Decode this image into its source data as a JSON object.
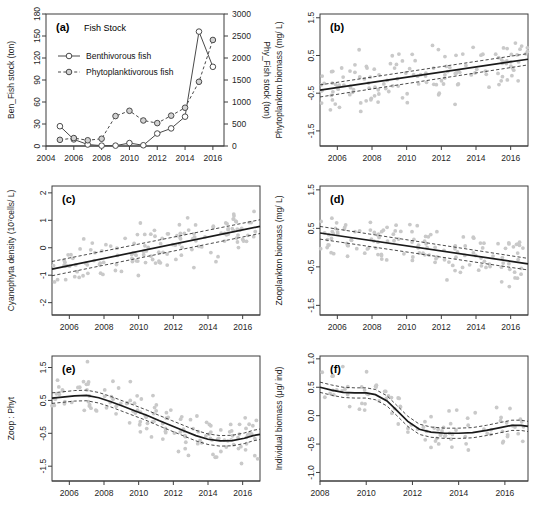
{
  "figure": {
    "panels": [
      "a",
      "b",
      "c",
      "d",
      "e",
      "f"
    ],
    "xlabel_years": [
      "2004",
      "2006",
      "2008",
      "2010",
      "2012",
      "2014",
      "2016"
    ]
  },
  "chart_data": [
    {
      "id": "a",
      "type": "line",
      "tag": "(a)",
      "title": "Fish Stock",
      "xlabel": "",
      "ylabel": "Ben_Fish stock (ton)",
      "y2label": "Phy_Fish stock (ton)",
      "xlim": [
        2004,
        2016.8
      ],
      "ylim": [
        0,
        180
      ],
      "y2lim": [
        0,
        3000
      ],
      "yticks": [
        0,
        30,
        60,
        90,
        120,
        150,
        180
      ],
      "y2ticks": [
        0,
        500,
        1000,
        1500,
        2000,
        2500,
        3000
      ],
      "xticks": [
        2004,
        2006,
        2008,
        2010,
        2012,
        2014,
        2016
      ],
      "grid": false,
      "legend_position": "top-left",
      "series": [
        {
          "name": "Benthivorous fish",
          "axis": "left",
          "style": "solid",
          "marker": "open-circle",
          "x": [
            2005,
            2006,
            2007,
            2008,
            2009,
            2010,
            2011,
            2012,
            2013,
            2014,
            2015,
            2016
          ],
          "values": [
            27,
            9,
            2,
            0.5,
            0.5,
            4,
            1,
            17,
            24,
            40,
            156,
            108
          ]
        },
        {
          "name": "Phytoplanktivorous fish",
          "axis": "right",
          "style": "dashed",
          "marker": "grey-circle",
          "x": [
            2005,
            2006,
            2007,
            2008,
            2009,
            2010,
            2011,
            2012,
            2013,
            2014,
            2015,
            2016
          ],
          "values": [
            140,
            180,
            130,
            165,
            680,
            800,
            580,
            520,
            690,
            870,
            1460,
            2410
          ]
        }
      ]
    },
    {
      "id": "b",
      "type": "scatter",
      "tag": "(b)",
      "ylabel": "Phytoplankton biomass (mg/ L)",
      "xlim": [
        2005,
        2017
      ],
      "ylim": [
        -1.9,
        1.6
      ],
      "yticks": [
        -1.5,
        -0.5,
        0.5,
        1.5
      ],
      "xticks": [
        2006,
        2008,
        2010,
        2012,
        2014,
        2016
      ],
      "fit": "linear-increasing",
      "fit_endpoints": [
        [
          2005,
          -0.42
        ],
        [
          2017,
          0.4
        ]
      ],
      "ci_upper": [
        [
          2005,
          -0.28
        ],
        [
          2017,
          0.55
        ]
      ],
      "ci_lower": [
        [
          2005,
          -0.6
        ],
        [
          2017,
          0.25
        ]
      ],
      "n_points": 140
    },
    {
      "id": "c",
      "type": "scatter",
      "tag": "(c)",
      "ylabel": "Cyanophyta density (10⁷cells/ L)",
      "xlim": [
        2005,
        2017
      ],
      "ylim": [
        -2.45,
        2.25
      ],
      "yticks": [
        -2,
        -1,
        0,
        1,
        2
      ],
      "xticks": [
        2006,
        2008,
        2010,
        2012,
        2014,
        2016
      ],
      "fit": "linear-increasing",
      "fit_endpoints": [
        [
          2005,
          -0.78
        ],
        [
          2017,
          0.78
        ]
      ],
      "ci_upper": [
        [
          2005,
          -0.5
        ],
        [
          2017,
          1.02
        ]
      ],
      "ci_lower": [
        [
          2005,
          -1.02
        ],
        [
          2017,
          0.52
        ]
      ],
      "n_points": 140
    },
    {
      "id": "d",
      "type": "scatter",
      "tag": "(d)",
      "ylabel": "Zooplankton biomass (mg/ L)",
      "xlim": [
        2005,
        2017
      ],
      "ylim": [
        -1.75,
        1.6
      ],
      "yticks": [
        -1.5,
        -0.5,
        0.5,
        1.5
      ],
      "xticks": [
        2006,
        2008,
        2010,
        2012,
        2014,
        2016
      ],
      "fit": "linear-decreasing",
      "fit_endpoints": [
        [
          2005,
          0.38
        ],
        [
          2017,
          -0.42
        ]
      ],
      "ci_upper": [
        [
          2005,
          0.55
        ],
        [
          2017,
          -0.28
        ]
      ],
      "ci_lower": [
        [
          2005,
          0.22
        ],
        [
          2017,
          -0.58
        ]
      ],
      "n_points": 140
    },
    {
      "id": "e",
      "type": "scatter",
      "tag": "(e)",
      "ylabel": "Zoop : Phyt",
      "xlim": [
        2005,
        2017
      ],
      "ylim": [
        -1.95,
        1.85
      ],
      "yticks": [
        -1.5,
        -0.5,
        0.5,
        1.5
      ],
      "xticks": [
        2006,
        2008,
        2010,
        2012,
        2014,
        2016
      ],
      "fit": "gam-smooth",
      "fit_curve": [
        [
          2005,
          0.57
        ],
        [
          2005.6,
          0.6
        ],
        [
          2006.3,
          0.64
        ],
        [
          2007,
          0.65
        ],
        [
          2007.7,
          0.58
        ],
        [
          2008.4,
          0.46
        ],
        [
          2009.1,
          0.32
        ],
        [
          2009.8,
          0.18
        ],
        [
          2010.5,
          0.04
        ],
        [
          2011.2,
          -0.12
        ],
        [
          2011.9,
          -0.27
        ],
        [
          2012.6,
          -0.42
        ],
        [
          2013.3,
          -0.57
        ],
        [
          2014,
          -0.68
        ],
        [
          2014.7,
          -0.73
        ],
        [
          2015.4,
          -0.72
        ],
        [
          2016.1,
          -0.65
        ],
        [
          2016.6,
          -0.57
        ],
        [
          2017,
          -0.53
        ]
      ],
      "ci_offset": 0.16,
      "n_points": 140
    },
    {
      "id": "f",
      "type": "scatter",
      "tag": "(f)",
      "ylabel": "Individual biomass (μg/ ind)",
      "xlim": [
        2008,
        2017
      ],
      "ylim": [
        -1.15,
        1.05
      ],
      "yticks": [
        -1.0,
        -0.5,
        0.0,
        0.5,
        1.0
      ],
      "xticks": [
        2008,
        2010,
        2012,
        2014,
        2016
      ],
      "fit": "gam-smooth",
      "fit_curve": [
        [
          2008,
          0.5
        ],
        [
          2008.5,
          0.45
        ],
        [
          2009,
          0.41
        ],
        [
          2009.5,
          0.4
        ],
        [
          2010,
          0.4
        ],
        [
          2010.4,
          0.37
        ],
        [
          2010.9,
          0.26
        ],
        [
          2011.3,
          0.1
        ],
        [
          2011.8,
          -0.1
        ],
        [
          2012.3,
          -0.24
        ],
        [
          2012.8,
          -0.29
        ],
        [
          2013.4,
          -0.31
        ],
        [
          2014,
          -0.31
        ],
        [
          2014.6,
          -0.3
        ],
        [
          2015.2,
          -0.26
        ],
        [
          2015.8,
          -0.21
        ],
        [
          2016.3,
          -0.17
        ],
        [
          2016.7,
          -0.17
        ],
        [
          2017,
          -0.19
        ]
      ],
      "ci_offset": 0.09,
      "n_points": 95
    }
  ]
}
